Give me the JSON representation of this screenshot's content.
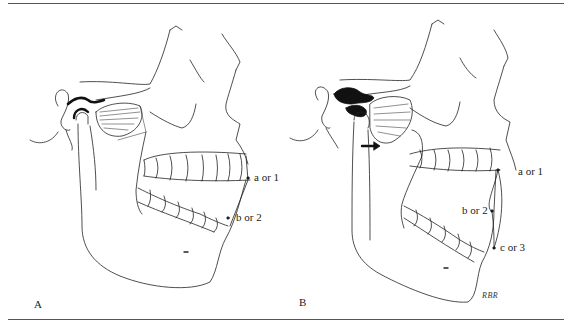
{
  "figure": {
    "panels": [
      {
        "label": "A",
        "points": [
          {
            "id": "a",
            "text": "a or 1"
          },
          {
            "id": "b",
            "text": "b or 2"
          }
        ]
      },
      {
        "label": "B",
        "points": [
          {
            "id": "a",
            "text": "a or 1"
          },
          {
            "id": "b",
            "text": "b or 2"
          },
          {
            "id": "c",
            "text": "c or 3"
          }
        ],
        "arrow": "right-arrow",
        "signature": "RBR"
      }
    ]
  }
}
